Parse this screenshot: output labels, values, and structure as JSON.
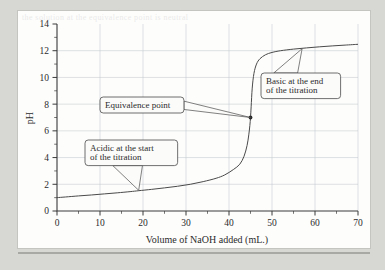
{
  "figure": {
    "ghost_artifact_text": "the solution at the equivalence point is neutral"
  },
  "chart_data": {
    "type": "line",
    "title": "",
    "subtitle": "",
    "xlabel": "Volume of NaOH added (mL.)",
    "ylabel": "pH",
    "xlim": [
      0,
      70
    ],
    "ylim": [
      0,
      14
    ],
    "x_ticks": [
      0,
      10,
      20,
      30,
      40,
      50,
      60,
      70
    ],
    "x_tick_labels": [
      "0",
      "10",
      "20",
      "30",
      "40",
      "50",
      "60",
      "70"
    ],
    "x_minor_tick_step": 5,
    "y_ticks": [
      0,
      2,
      4,
      6,
      8,
      10,
      12,
      14
    ],
    "y_tick_labels": [
      "0",
      "2",
      "4",
      "6",
      "8",
      "10",
      "12",
      "14"
    ],
    "y_minor_tick_step": 1,
    "grid": true,
    "grid_axes": "both",
    "legend": false,
    "legend_position": "none",
    "series": [
      {
        "name": "Titration curve",
        "x": [
          0,
          2,
          5,
          8,
          11,
          14,
          17,
          19,
          22,
          25,
          28,
          31,
          34,
          37,
          39,
          41,
          42.5,
          43.5,
          44.2,
          44.6,
          44.85,
          45,
          45.15,
          45.4,
          45.8,
          46.4,
          47.2,
          48.5,
          50,
          52,
          55,
          58,
          61,
          64,
          67,
          70
        ],
        "y": [
          1.0,
          1.05,
          1.13,
          1.2,
          1.28,
          1.36,
          1.45,
          1.52,
          1.62,
          1.73,
          1.85,
          2.0,
          2.2,
          2.45,
          2.7,
          3.1,
          3.5,
          4.1,
          4.9,
          5.7,
          6.4,
          7.0,
          7.8,
          9.2,
          10.3,
          11.0,
          11.4,
          11.7,
          11.87,
          12.0,
          12.12,
          12.21,
          12.29,
          12.36,
          12.42,
          12.48
        ]
      }
    ],
    "markers": [
      {
        "name": "equivalence-point",
        "x": 45,
        "y": 7
      }
    ],
    "annotations": [
      {
        "name": "equivalence-point-callout",
        "lines": [
          "Equivalence point"
        ],
        "target_x": 45,
        "target_y": 7
      },
      {
        "name": "basic-end-callout",
        "lines": [
          "Basic at the end",
          "of the titration"
        ],
        "target_x": 57,
        "target_y": 12.15
      },
      {
        "name": "acidic-start-callout",
        "lines": [
          "Acidic at the start",
          "of the titration"
        ],
        "target_x": 19,
        "target_y": 1.55
      }
    ]
  },
  "colors": {
    "page_background": "#d7d7d6",
    "plate_background": "#fdfdfc",
    "axis": "#3a3a3a",
    "grid": "#c8ccd0",
    "curve": "#4a4a4a",
    "callout_fill": "#fbfbfa",
    "callout_stroke": "#4a4a4a"
  }
}
